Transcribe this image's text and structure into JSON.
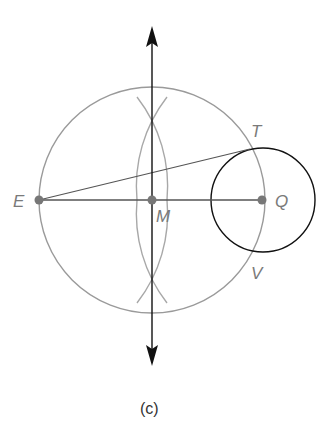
{
  "figure": {
    "caption": "(c)",
    "points": {
      "E": {
        "label": "E",
        "x": 39,
        "y": 200
      },
      "M": {
        "label": "M",
        "x": 152,
        "y": 200
      },
      "Q": {
        "label": "Q",
        "x": 262,
        "y": 200
      },
      "T": {
        "label": "T",
        "x": 250,
        "y": 148
      },
      "V": {
        "label": "V",
        "x": 250,
        "y": 252
      }
    },
    "colors": {
      "construction": "#9a9a9a",
      "primary": "#111111",
      "point": "#777777",
      "label": "#7a7a7a"
    },
    "elements": [
      "perpendicular bisector of EQ (double arrow)",
      "circle centered at M through E and Q",
      "construction arcs from E and Q",
      "circle centered at Q through T and V",
      "segment E to T",
      "segment E to Q"
    ]
  }
}
